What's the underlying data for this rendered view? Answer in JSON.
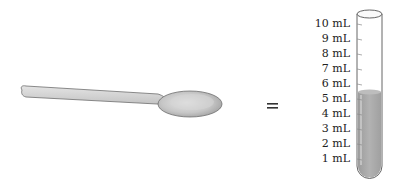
{
  "diagram": {
    "left_item": "teaspoon",
    "operator": "=",
    "right_item": "test tube",
    "tube": {
      "scale_labels": [
        "10 mL",
        "9 mL",
        "8 mL",
        "7 mL",
        "6 mL",
        "5 mL",
        "4 mL",
        "3 mL",
        "2 mL",
        "1 mL"
      ],
      "fill_level": "5 mL",
      "liquid_color": "#a8a8a8"
    }
  }
}
